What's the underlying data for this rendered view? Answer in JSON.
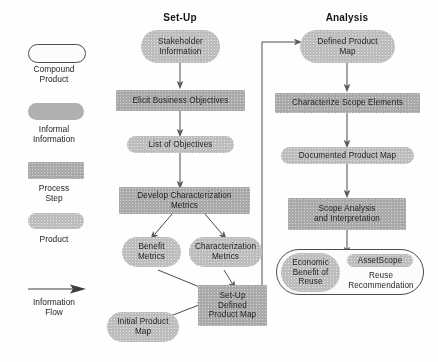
{
  "diagram": {
    "columns": [
      {
        "key": "setup",
        "label": "Set-Up"
      },
      {
        "key": "analysis",
        "label": "Analysis"
      }
    ],
    "colors": {
      "process_step": "#a9a9a9",
      "product": "#bdbdbd",
      "compound_product_fill": "#fdfdfd",
      "compound_product_border": "#4a4a4a",
      "arrow": "#3a3a3a",
      "text": "#1b1b1b",
      "background": "#ffffff"
    }
  },
  "legend": {
    "items": [
      {
        "shape": "compound-product",
        "label": "Compound\nProduct"
      },
      {
        "shape": "informal-information",
        "label": "Informal\nInformation"
      },
      {
        "shape": "process-step",
        "label": "Process\nStep"
      },
      {
        "shape": "product",
        "label": "Product"
      },
      {
        "shape": "information-flow-arrow",
        "label": "Information\nFlow"
      }
    ],
    "labels": {
      "compound_product": "Compound Product",
      "informal_information": "Informal Information",
      "process_step": "Process Step",
      "product": "Product",
      "information_flow": "Information Flow"
    },
    "lines": {
      "compound_1": "Compound",
      "compound_2": "Product",
      "informal_1": "Informal",
      "informal_2": "Information",
      "process_1": "Process",
      "process_2": "Step",
      "product_1": "Product",
      "flow_1": "Information",
      "flow_2": "Flow"
    }
  },
  "setup": {
    "title": "Set-Up",
    "nodes": {
      "stakeholder_information": {
        "line1": "Stakeholder",
        "line2": "Information",
        "type": "informal-information"
      },
      "elicit_business_objectives": {
        "line1": "Elicit Business Objectives",
        "type": "process-step"
      },
      "list_of_objectives": {
        "line1": "List of Objectives",
        "type": "product"
      },
      "develop_characterization_metrics": {
        "line1": "Develop Characterization",
        "line2": "Metrics",
        "type": "process-step"
      },
      "benefit_metrics": {
        "line1": "Benefit",
        "line2": "Metrics",
        "type": "product"
      },
      "characterization_metrics": {
        "line1": "Characterization",
        "line2": "Metrics",
        "type": "product"
      },
      "initial_product_map": {
        "line1": "Initial Product",
        "line2": "Map",
        "type": "product"
      },
      "setup_defined_product_map": {
        "line1": "Set-Up",
        "line2": "Defined",
        "line3": "Product Map",
        "type": "process-step"
      }
    }
  },
  "analysis": {
    "title": "Analysis",
    "nodes": {
      "defined_product_map": {
        "line1": "Defined Product",
        "line2": "Map",
        "type": "product"
      },
      "characterize_scope_elements": {
        "line1": "Characterize Scope Elements",
        "type": "process-step"
      },
      "documented_product_map": {
        "line1": "Documented Product Map",
        "type": "product"
      },
      "scope_analysis_and_interpretation": {
        "line1": "Scope Analysis",
        "line2": "and Interpretation",
        "type": "process-step"
      },
      "compound_output": {
        "type": "compound-product",
        "economic_benefit": {
          "line1": "Economic",
          "line2": "Benefit of",
          "line3": "Reuse"
        },
        "assetscope": {
          "line1": "AssetScope"
        },
        "reuse_recommendation": {
          "line1": "Reuse",
          "line2": "Recommendation"
        }
      }
    }
  },
  "flows": [
    {
      "from": "stakeholder_information",
      "to": "elicit_business_objectives"
    },
    {
      "from": "elicit_business_objectives",
      "to": "list_of_objectives"
    },
    {
      "from": "list_of_objectives",
      "to": "develop_characterization_metrics"
    },
    {
      "from": "develop_characterization_metrics",
      "to": "benefit_metrics"
    },
    {
      "from": "develop_characterization_metrics",
      "to": "characterization_metrics"
    },
    {
      "from": "benefit_metrics",
      "to": "setup_defined_product_map"
    },
    {
      "from": "characterization_metrics",
      "to": "setup_defined_product_map"
    },
    {
      "from": "initial_product_map",
      "to": "setup_defined_product_map"
    },
    {
      "from": "setup_defined_product_map",
      "to": "defined_product_map"
    },
    {
      "from": "defined_product_map",
      "to": "characterize_scope_elements"
    },
    {
      "from": "characterize_scope_elements",
      "to": "documented_product_map"
    },
    {
      "from": "documented_product_map",
      "to": "scope_analysis_and_interpretation"
    },
    {
      "from": "scope_analysis_and_interpretation",
      "to": "compound_output"
    }
  ]
}
